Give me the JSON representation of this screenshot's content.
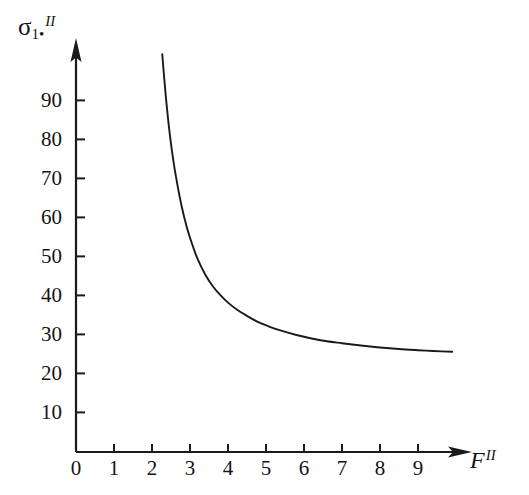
{
  "chart_data": {
    "type": "line",
    "title": "",
    "xlabel": "F^II",
    "ylabel": "sigma_1.^II",
    "xlim": [
      0,
      10.2
    ],
    "ylim": [
      0,
      103
    ],
    "grid": false,
    "legend": null,
    "x_ticks": [
      "0",
      "1",
      "2",
      "3",
      "4",
      "5",
      "6",
      "7",
      "8",
      "9"
    ],
    "x_tick_values": [
      0,
      1,
      2,
      3,
      4,
      5,
      6,
      7,
      8,
      9
    ],
    "y_ticks": [
      "10",
      "20",
      "30",
      "40",
      "50",
      "60",
      "70",
      "80",
      "90"
    ],
    "y_tick_values": [
      10,
      20,
      30,
      40,
      50,
      60,
      70,
      80,
      90
    ],
    "series": [
      {
        "name": "sigma_1 vs F",
        "color": "#1a1a1a",
        "x": [
          2.27,
          2.32,
          2.38,
          2.45,
          2.55,
          2.65,
          2.78,
          2.92,
          3.05,
          3.2,
          3.4,
          3.6,
          3.8,
          4.0,
          4.25,
          4.5,
          4.8,
          5.1,
          5.4,
          5.8,
          6.2,
          6.6,
          7.0,
          7.5,
          8.0,
          8.5,
          9.0,
          9.4,
          9.9
        ],
        "y": [
          102.0,
          96.0,
          89.5,
          83.0,
          75.5,
          69.5,
          63.0,
          57.5,
          53.5,
          49.5,
          45.5,
          42.5,
          40.2,
          38.3,
          36.4,
          34.9,
          33.3,
          32.1,
          31.1,
          30.0,
          29.1,
          28.4,
          27.9,
          27.3,
          26.8,
          26.4,
          26.1,
          25.9,
          25.7
        ]
      }
    ],
    "annotations": []
  },
  "axes": {
    "y_label_symbol": "σ",
    "y_label_sub": "1•",
    "y_label_sup": "II",
    "x_label_symbol": "F",
    "x_label_sup": "II",
    "origin_label": "0"
  },
  "style": {
    "axis_color": "#1a1a1a",
    "curve_color": "#1a1a1a",
    "text_color": "#141414",
    "background": "#ffffff"
  }
}
